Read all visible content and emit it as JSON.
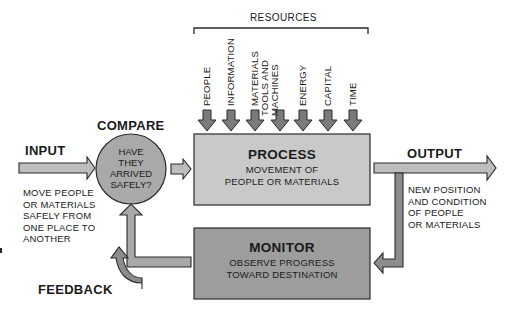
{
  "diagram": {
    "resources": {
      "heading": "RESOURCES",
      "items": [
        {
          "line1": "PEOPLE",
          "line2": ""
        },
        {
          "line1": "INFORMATION",
          "line2": ""
        },
        {
          "line1": "MATERIALS",
          "line2": ""
        },
        {
          "line1": "TOOLS AND",
          "line2": "MACHINES"
        },
        {
          "line1": "ENERGY",
          "line2": ""
        },
        {
          "line1": "CAPITAL",
          "line2": ""
        },
        {
          "line1": "TIME",
          "line2": ""
        }
      ]
    },
    "input": {
      "label": "INPUT",
      "description": [
        "MOVE PEOPLE",
        "OR MATERIALS",
        "SAFELY FROM",
        "ONE PLACE TO",
        "ANOTHER"
      ]
    },
    "compare": {
      "label": "COMPARE",
      "question": [
        "HAVE",
        "THEY",
        "ARRIVED",
        "SAFELY?"
      ]
    },
    "process": {
      "title": "PROCESS",
      "description": [
        "MOVEMENT OF",
        "PEOPLE OR MATERIALS"
      ]
    },
    "output": {
      "label": "OUTPUT",
      "description": [
        "NEW POSITION",
        "AND CONDITION",
        "OF PEOPLE",
        "OR MATERIALS"
      ]
    },
    "monitor": {
      "title": "MONITOR",
      "description": [
        "OBSERVE PROGRESS",
        "TOWARD DESTINATION"
      ]
    },
    "feedback": {
      "label": "FEEDBACK"
    },
    "colors": {
      "process_fill": "#c9c9c9",
      "monitor_fill": "#9d9d9d",
      "circle_fill": "#a9a9a9",
      "arrow_light": "#bdbdbd",
      "arrow_dark": "#8c8c8c",
      "resource_arrow": "#7a7a7a",
      "stroke": "#2a2a2a"
    }
  }
}
